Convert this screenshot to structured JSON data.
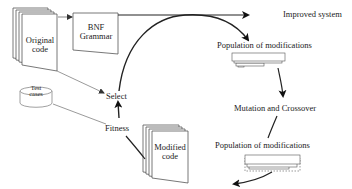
{
  "diagram": {
    "nodes": {
      "original_code": {
        "line1": "Original",
        "line2": "code"
      },
      "bnf_grammar": {
        "line1": "BNF",
        "line2": "Grammar"
      },
      "test_cases": {
        "line1": "Test",
        "line2": "cases"
      },
      "select": {
        "label": "Select"
      },
      "fitness": {
        "label": "Fitness"
      },
      "modified_code": {
        "line1": "Modified",
        "line2": "code"
      },
      "population_top": {
        "label": "Population of modifications"
      },
      "mutation_crossover": {
        "label": "Mutation and Crossover"
      },
      "population_bottom": {
        "label": "Population of modifications"
      },
      "improved_system": {
        "label": "Improved system"
      }
    },
    "edges": [
      {
        "from": "original_code",
        "to": "bnf_grammar"
      },
      {
        "from": "original_code",
        "to": "select"
      },
      {
        "from": "bnf_grammar",
        "to": "improved_system"
      },
      {
        "from": "select",
        "to": "population_top"
      },
      {
        "from": "population_top",
        "to": "mutation_crossover"
      },
      {
        "from": "mutation_crossover",
        "to": "population_bottom"
      },
      {
        "from": "population_bottom",
        "to": "modified_code"
      },
      {
        "from": "modified_code",
        "to": "fitness"
      },
      {
        "from": "test_cases",
        "to": "fitness"
      },
      {
        "from": "fitness",
        "to": "select"
      }
    ],
    "colors": {
      "line": "#222222",
      "thin_line": "#555555",
      "background": "#ffffff"
    }
  }
}
